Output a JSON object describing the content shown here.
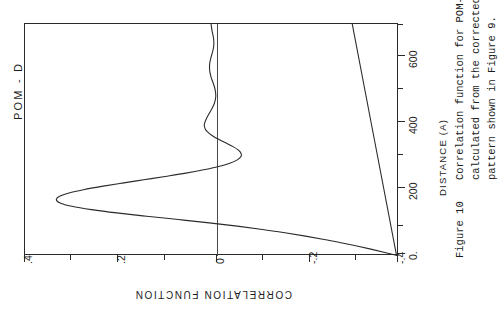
{
  "caption": {
    "label": "Figure 10",
    "lines": [
      "Correlation function for POM-D",
      "calculated from the corrected",
      "pattern shown in Figure 9."
    ]
  },
  "chart_data": {
    "type": "line",
    "title": "Correlation function for POM-D",
    "series_label": "POM - D",
    "orientation": "rotated-90-ccw",
    "xlabel": "DISTANCE (A)",
    "ylabel": "CORRELATION FUNCTION",
    "xlim": [
      0,
      700
    ],
    "ylim": [
      -0.4,
      0.4
    ],
    "xticks": [
      0,
      200,
      400,
      600
    ],
    "xtick_labels": [
      "0.",
      "200",
      "400",
      "600"
    ],
    "xminor_ticks": [
      100,
      300,
      500,
      700
    ],
    "yticks": [
      0.4,
      0.2,
      0,
      -0.2,
      -0.4
    ],
    "ytick_labels": [
      ".4",
      ".2",
      "0",
      "-.2",
      "-.4"
    ],
    "yminor_ticks": [
      0.3,
      0.1,
      -0.1,
      -0.3
    ],
    "grid": false,
    "legend": "none",
    "line_color": "#2b2b2b",
    "zero_reference_line": 0,
    "x": [
      0,
      10,
      20,
      30,
      40,
      50,
      60,
      70,
      80,
      90,
      100,
      110,
      120,
      130,
      140,
      150,
      160,
      170,
      180,
      190,
      200,
      210,
      220,
      230,
      240,
      250,
      260,
      270,
      280,
      290,
      300,
      310,
      320,
      330,
      340,
      350,
      360,
      370,
      380,
      390,
      400,
      420,
      440,
      460,
      480,
      500,
      520,
      540,
      560,
      580,
      600,
      620,
      640,
      660,
      680,
      700
    ],
    "y": [
      -0.4,
      -0.372,
      -0.342,
      -0.31,
      -0.276,
      -0.24,
      -0.2,
      -0.156,
      -0.108,
      -0.054,
      0.006,
      0.072,
      0.14,
      0.204,
      0.258,
      0.3,
      0.325,
      0.333,
      0.326,
      0.306,
      0.275,
      0.236,
      0.192,
      0.146,
      0.1,
      0.056,
      0.018,
      -0.014,
      -0.038,
      -0.054,
      -0.062,
      -0.062,
      -0.056,
      -0.045,
      -0.031,
      -0.017,
      -0.004,
      0.006,
      0.013,
      0.016,
      0.016,
      0.01,
      0.002,
      -0.005,
      -0.008,
      -0.007,
      -0.003,
      0.002,
      0.005,
      0.005,
      0.002,
      -0.002,
      -0.004,
      -0.003,
      0.0,
      0.002
    ],
    "secondary_baseline": {
      "description": "near-flat drifting baseline crossing the plot",
      "x": [
        0,
        700
      ],
      "y": [
        -0.395,
        -0.3
      ]
    }
  }
}
